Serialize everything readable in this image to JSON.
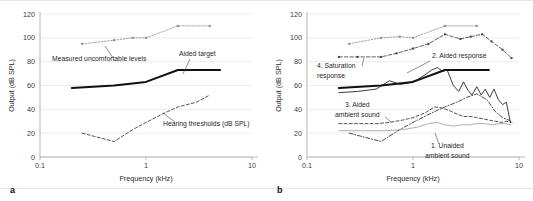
{
  "figure": {
    "background": "#ffffff",
    "panels": [
      {
        "letter": "a",
        "chart_data": {
          "type": "line",
          "title": "",
          "xlabel": "Frequency (kHz)",
          "ylabel": "Output (dB SPL)",
          "xscale": "log",
          "xlim": [
            0.1,
            10
          ],
          "ylim": [
            0,
            120
          ],
          "xticks": [
            0.1,
            1,
            10
          ],
          "xtick_labels": [
            "0.1",
            "1",
            "10"
          ],
          "yticks": [
            0,
            20,
            40,
            60,
            80,
            100,
            120
          ],
          "ytick_labels": [
            "0",
            "20",
            "40",
            "60",
            "80",
            "100",
            "120"
          ],
          "grid": true,
          "legend": "annotations",
          "series": [
            {
              "name": "Measured uncomfortable levels",
              "style": "dotted-marker",
              "color": "#8a8a8a",
              "x": [
                0.25,
                0.5,
                0.75,
                1.0,
                2.0,
                4.0
              ],
              "y": [
                95,
                98,
                100,
                100,
                110,
                110
              ]
            },
            {
              "name": "Aided target",
              "style": "solid-thick",
              "color": "#111111",
              "x": [
                0.2,
                0.5,
                1.0,
                2.0,
                4.0,
                5.0
              ],
              "y": [
                58,
                60,
                63,
                73,
                73,
                73
              ]
            },
            {
              "name": "Hearing thresholds (dB SPL)",
              "style": "dashed",
              "color": "#333333",
              "x": [
                0.25,
                0.5,
                0.75,
                1.0,
                1.5,
                2.0,
                3.0,
                4.0
              ],
              "y": [
                20,
                13,
                23,
                29,
                37,
                42,
                46,
                52
              ]
            }
          ],
          "annotations": [
            {
              "text": "Measured uncomfortable levels",
              "x_px": 52,
              "y_px": 61,
              "leader": [
                [
                  113,
                  58
                ],
                [
                  105,
                  46
                ]
              ]
            },
            {
              "text": "Aided target",
              "x_px": 179,
              "y_px": 56,
              "leader": [
                [
                  190,
                  59
                ],
                [
                  183,
                  74
                ]
              ]
            },
            {
              "text": "Hearing thresholds (dB SPL)",
              "x_px": 163,
              "y_px": 126,
              "leader": [
                [
                  175,
                  122
                ],
                [
                  163,
                  113
                ]
              ]
            }
          ]
        }
      },
      {
        "letter": "b",
        "chart_data": {
          "type": "line",
          "title": "",
          "xlabel": "Frequency (kHz)",
          "ylabel": "Output (dB SPL)",
          "xscale": "log",
          "xlim": [
            0.1,
            10
          ],
          "ylim": [
            0,
            120
          ],
          "xticks": [
            0.1,
            1,
            10
          ],
          "xtick_labels": [
            "0.1",
            "1",
            "10"
          ],
          "yticks": [
            0,
            20,
            40,
            60,
            80,
            100,
            120
          ],
          "ytick_labels": [
            "0",
            "20",
            "40",
            "60",
            "80",
            "100",
            "120"
          ],
          "grid": true,
          "legend": "annotations",
          "series": [
            {
              "name": "Measured uncomfortable levels",
              "style": "dotted-marker",
              "color": "#8a8a8a",
              "x": [
                0.25,
                0.5,
                0.75,
                1.0,
                2.0,
                4.0
              ],
              "y": [
                95,
                100,
                101,
                100,
                110,
                110
              ]
            },
            {
              "name": "4. Saturation response",
              "style": "dashed-marker",
              "color": "#444444",
              "x": [
                0.2,
                0.3,
                0.5,
                0.7,
                1.0,
                1.4,
                2.0,
                2.8,
                3.5,
                4.5,
                5.5,
                7.0,
                8.5
              ],
              "y": [
                84,
                84,
                84,
                87,
                91,
                95,
                103,
                99,
                101,
                103,
                97,
                90,
                83
              ]
            },
            {
              "name": "2. Aided response",
              "style": "solid-thin-jagged",
              "color": "#1a1a1a",
              "x": [
                0.2,
                0.3,
                0.45,
                0.6,
                0.75,
                0.9,
                1.1,
                1.3,
                1.5,
                1.7,
                1.9,
                2.1,
                2.4,
                2.7,
                3.0,
                3.3,
                3.6,
                4.0,
                4.4,
                4.8,
                5.3,
                5.8,
                6.4,
                7.0,
                7.6,
                8.3
              ],
              "y": [
                54,
                55,
                57,
                64,
                61,
                62,
                65,
                69,
                73,
                75,
                72,
                73,
                60,
                55,
                63,
                56,
                52,
                59,
                52,
                57,
                50,
                57,
                48,
                44,
                46,
                29
              ]
            },
            {
              "name": "Aided target",
              "style": "solid-thick",
              "color": "#111111",
              "x": [
                0.2,
                0.5,
                1.0,
                2.0,
                4.0,
                5.2
              ],
              "y": [
                58,
                60,
                63,
                73,
                73,
                73
              ]
            },
            {
              "name": "3. Aided ambient sound",
              "style": "dashed",
              "color": "#333333",
              "x": [
                0.2,
                0.3,
                0.45,
                0.6,
                0.8,
                1.0,
                1.3,
                1.6,
                1.9,
                2.2,
                2.6,
                3.0,
                3.5,
                4.0,
                4.6,
                5.2,
                6.0,
                6.8,
                7.6,
                8.4
              ],
              "y": [
                28,
                28,
                28,
                29,
                31,
                33,
                37,
                42,
                41,
                39,
                36,
                34,
                34,
                33,
                32,
                31,
                30,
                29,
                30,
                29
              ]
            },
            {
              "name": "Hearing thresholds",
              "style": "dash-dot",
              "color": "#2a2a2a",
              "x": [
                0.25,
                0.5,
                0.75,
                1.0,
                1.5,
                2.0,
                2.6,
                3.2,
                4.0,
                5.0,
                6.0,
                7.0,
                8.0,
                8.6
              ],
              "y": [
                20,
                13,
                23,
                29,
                37,
                42,
                46,
                50,
                53,
                48,
                38,
                33,
                31,
                29
              ]
            },
            {
              "name": "1. Unaided ambient sound",
              "style": "solid-thin-light",
              "color": "#9a9a9a",
              "x": [
                0.2,
                0.35,
                0.55,
                0.8,
                1.1,
                1.4,
                1.7,
                2.0,
                2.4,
                2.9,
                3.4,
                4.0,
                4.8,
                5.6,
                6.5,
                7.4,
                8.4
              ],
              "y": [
                22,
                22,
                22,
                23,
                25,
                28,
                29,
                27,
                26,
                27,
                27,
                28,
                28,
                27,
                28,
                28,
                27
              ]
            }
          ],
          "annotations": [
            {
              "text": "4. Saturation",
              "x_px": 50,
              "y_px": 68,
              "leader": [
                [
                  95,
                  66
                ],
                [
                  97,
                  58
                ]
              ]
            },
            {
              "text": "response",
              "x_px": 50,
              "y_px": 78,
              "leader": null
            },
            {
              "text": "2. Aided response",
              "x_px": 165,
              "y_px": 58,
              "leader": [
                [
                  163,
                  61
                ],
                [
                  140,
                  73
                ]
              ]
            },
            {
              "text": "3. Aided",
              "x_px": 78,
              "y_px": 107,
              "leader": [
                [
                  118,
                  117
                ],
                [
                  124,
                  122
                ]
              ]
            },
            {
              "text": "ambient sound",
              "x_px": 68,
              "y_px": 117,
              "leader": null
            },
            {
              "text": "1. Unaided",
              "x_px": 164,
              "y_px": 148,
              "leader": [
                [
                  172,
                  144
                ],
                [
                  168,
                  133
                ]
              ]
            },
            {
              "text": "ambient sound",
              "x_px": 158,
              "y_px": 158,
              "leader": null
            }
          ]
        }
      }
    ]
  }
}
